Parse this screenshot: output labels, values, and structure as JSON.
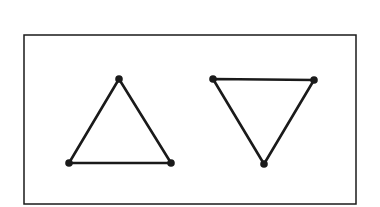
{
  "diagram": {
    "stroke_color": "#1a1a1a",
    "background": "#ffffff",
    "frame": {
      "x": 24,
      "y": 35,
      "width": 332,
      "height": 169
    },
    "shapes": [
      {
        "name": "upward-triangle",
        "vertices": [
          [
            119,
            79
          ],
          [
            69,
            163
          ],
          [
            171,
            163
          ]
        ]
      },
      {
        "name": "downward-triangle",
        "vertices": [
          [
            213,
            79
          ],
          [
            314,
            80
          ],
          [
            264,
            164
          ]
        ]
      }
    ]
  }
}
